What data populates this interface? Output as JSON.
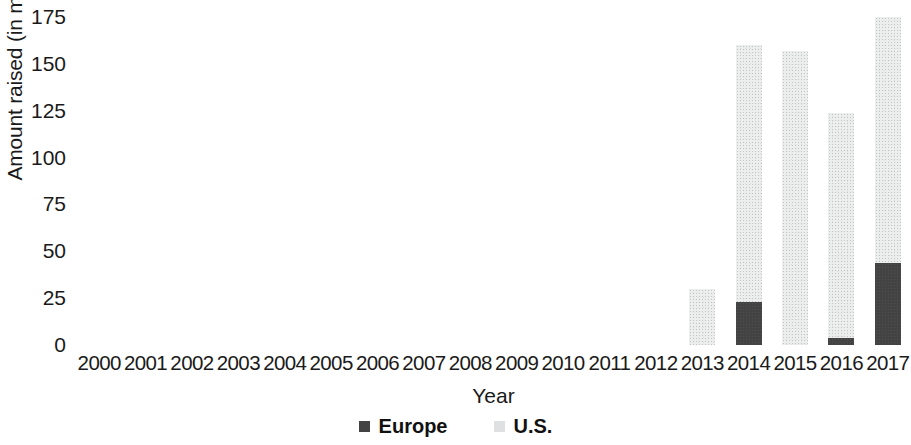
{
  "chart_data": {
    "type": "bar",
    "stacked": true,
    "title": "",
    "subtitle": "",
    "xlabel": "Year",
    "ylabel": "Amount raised (in million EUR)",
    "categories": [
      "2000",
      "2001",
      "2002",
      "2003",
      "2004",
      "2005",
      "2006",
      "2007",
      "2008",
      "2009",
      "2010",
      "2011",
      "2012",
      "2013",
      "2014",
      "2015",
      "2016",
      "2017"
    ],
    "series": [
      {
        "name": "Europe",
        "color": "#434343",
        "values": [
          0,
          0,
          0,
          0,
          0,
          0,
          0,
          0,
          0,
          0,
          0,
          0,
          0,
          0,
          23,
          0,
          4,
          44
        ]
      },
      {
        "name": "U.S.",
        "color": "#eceded",
        "values": [
          0,
          0,
          0,
          0,
          0,
          0,
          0,
          0,
          0,
          0,
          0,
          0,
          0,
          30,
          137,
          157,
          120,
          131
        ]
      }
    ],
    "totals": [
      0,
      0,
      0,
      0,
      0,
      0,
      0,
      0,
      0,
      0,
      0,
      0,
      0,
      30,
      160,
      157,
      124,
      175
    ],
    "ylim": [
      0,
      175
    ],
    "yticks": [
      0,
      25,
      50,
      75,
      100,
      125,
      150,
      175
    ],
    "ytick_labels": [
      "0",
      "25",
      "50",
      "75",
      "100",
      "125",
      "150",
      "175"
    ],
    "grid": false,
    "legend_position": "bottom"
  },
  "legend": {
    "entries": [
      {
        "label": "Europe",
        "swatch": "dark-square-icon"
      },
      {
        "label": "U.S.",
        "swatch": "light-square-icon"
      }
    ]
  },
  "axes": {
    "y_title": "Amount raised (in million EUR)",
    "x_title": "Year"
  }
}
